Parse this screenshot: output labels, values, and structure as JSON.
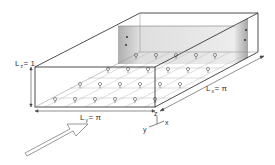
{
  "diagram": {
    "type": "3d-channel-domain",
    "labels": {
      "height": {
        "symbol": "L",
        "subscript": "z",
        "value": "= 1"
      },
      "width": {
        "symbol": "L",
        "subscript": "y",
        "value": "= π"
      },
      "length": {
        "symbol": "L",
        "subscript": "x",
        "value": "= π"
      }
    },
    "axes": {
      "z": "z",
      "y": "y",
      "x": "x"
    },
    "elements": [
      "box-outline",
      "shaded-back-wall",
      "grid-of-probes-on-floor",
      "inflow-arrow"
    ],
    "colors": {
      "line": "#222222",
      "grid": "#bbbbbb",
      "shade_dark": "#9a9a9a",
      "shade_light": "#e4e4e4",
      "probe": "#555555"
    }
  }
}
